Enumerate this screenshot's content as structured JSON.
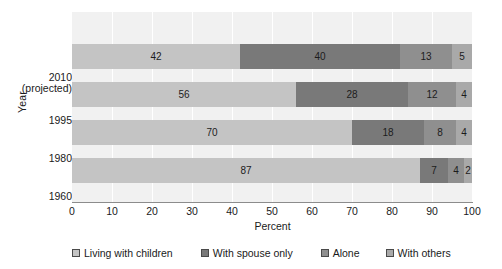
{
  "chart_data": {
    "type": "bar",
    "orientation": "horizontal",
    "stacked": true,
    "title": "",
    "xlabel": "Percent",
    "ylabel": "Year",
    "categories": [
      "2010 (projected)",
      "1995",
      "1980",
      "1960"
    ],
    "category_labels": [
      {
        "main": "2010",
        "sub": "(projected)"
      },
      {
        "main": "1995",
        "sub": ""
      },
      {
        "main": "1980",
        "sub": ""
      },
      {
        "main": "1960",
        "sub": ""
      }
    ],
    "series": [
      {
        "name": "Living with children",
        "color": "#c4c4c4",
        "values": [
          42,
          56,
          70,
          87
        ]
      },
      {
        "name": "With spouse only",
        "color": "#797979",
        "values": [
          40,
          28,
          18,
          7
        ]
      },
      {
        "name": "Alone",
        "color": "#8f8f8f",
        "values": [
          13,
          12,
          8,
          4
        ]
      },
      {
        "name": "With others",
        "color": "#a9a9a9",
        "values": [
          5,
          4,
          4,
          2
        ]
      }
    ],
    "xlim": [
      0,
      100
    ],
    "xticks": [
      0,
      10,
      20,
      30,
      40,
      50,
      60,
      70,
      80,
      90,
      100
    ],
    "xtick_labels": [
      "0",
      "10",
      "20",
      "30",
      "40",
      "50",
      "60",
      "70",
      "80",
      "90",
      "100"
    ],
    "grid": "vertical",
    "plot_background": "#f1f1f1",
    "gridline_color": "#ffffff",
    "axis_color": "#8c8c8c",
    "legend_position": "bottom",
    "data_labels": true
  }
}
